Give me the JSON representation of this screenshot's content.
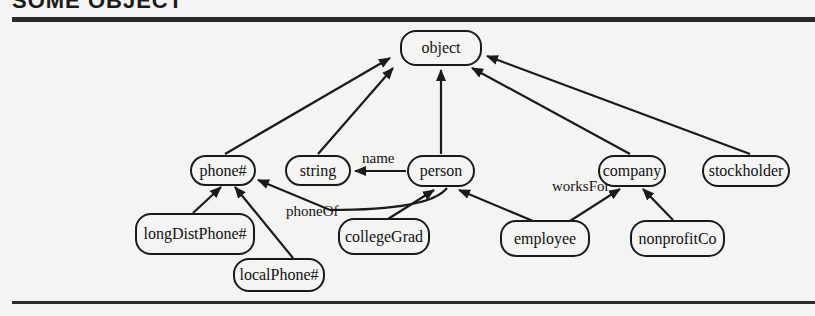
{
  "heading": "SOME OBJECT",
  "colors": {
    "stroke": "#1a1a1a",
    "background": "#f4f4f2"
  },
  "nodes": {
    "object": "object",
    "phone": "phone#",
    "string": "string",
    "person": "person",
    "company": "company",
    "stockholder": "stockholder",
    "longDistPhone": "longDistPhone#",
    "localPhone": "localPhone#",
    "collegeGrad": "collegeGrad",
    "employee": "employee",
    "nonprofitCo": "nonprofitCo"
  },
  "edge_labels": {
    "name": "name",
    "phoneOf": "phoneOf",
    "worksFor": "worksFor"
  },
  "edges": [
    {
      "from": "phone#",
      "to": "object",
      "type": "isa"
    },
    {
      "from": "string",
      "to": "object",
      "type": "isa"
    },
    {
      "from": "person",
      "to": "object",
      "type": "isa"
    },
    {
      "from": "company",
      "to": "object",
      "type": "isa"
    },
    {
      "from": "stockholder",
      "to": "object",
      "type": "isa"
    },
    {
      "from": "person",
      "to": "string",
      "label": "name"
    },
    {
      "from": "person",
      "to": "phone#",
      "label": "phoneOf"
    },
    {
      "from": "longDistPhone#",
      "to": "phone#",
      "type": "isa"
    },
    {
      "from": "localPhone#",
      "to": "phone#",
      "type": "isa"
    },
    {
      "from": "collegeGrad",
      "to": "person",
      "type": "isa"
    },
    {
      "from": "employee",
      "to": "person",
      "type": "isa"
    },
    {
      "from": "employee",
      "to": "company",
      "label": "worksFor"
    },
    {
      "from": "nonprofitCo",
      "to": "company",
      "type": "isa"
    }
  ]
}
